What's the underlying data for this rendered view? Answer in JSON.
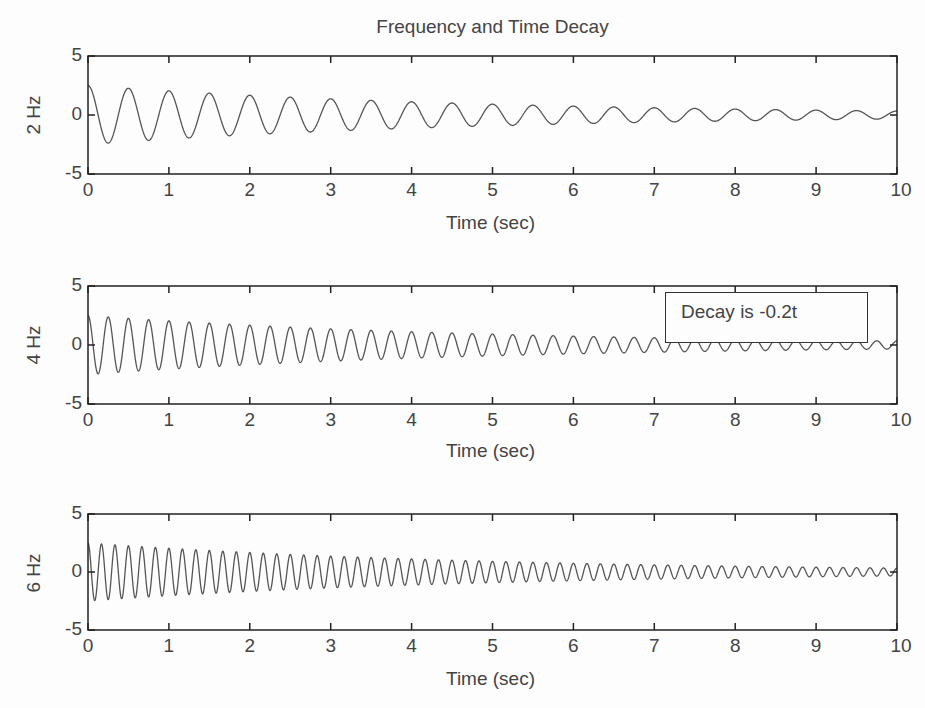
{
  "figure": {
    "title": "Frequency and Time Decay",
    "width": 925,
    "height": 708,
    "line_color": "#555555",
    "axes_color": "#222222"
  },
  "chart_data": [
    {
      "type": "line",
      "title": "Frequency and Time Decay",
      "xlabel": "Time (sec)",
      "ylabel": "2 Hz",
      "xlim": [
        0,
        10
      ],
      "ylim": [
        -5,
        5
      ],
      "xticks": [
        "0",
        "1",
        "2",
        "3",
        "4",
        "5",
        "6",
        "7",
        "8",
        "9",
        "10"
      ],
      "yticks": [
        "5",
        "0",
        "-5"
      ],
      "grid": false,
      "series": [
        {
          "name": "2 Hz",
          "function": "2.5*exp(-0.2t)*cos(2*pi*2*t)",
          "frequency_hz": 2,
          "amplitude": 2.5,
          "decay": -0.2
        }
      ],
      "box": {
        "left": 88,
        "top": 56,
        "right": 897,
        "bottom": 174
      }
    },
    {
      "type": "line",
      "xlabel": "Time (sec)",
      "ylabel": "4 Hz",
      "xlim": [
        0,
        10
      ],
      "ylim": [
        -5,
        5
      ],
      "xticks": [
        "0",
        "1",
        "2",
        "3",
        "4",
        "5",
        "6",
        "7",
        "8",
        "9",
        "10"
      ],
      "yticks": [
        "5",
        "0",
        "-5"
      ],
      "grid": false,
      "series": [
        {
          "name": "4 Hz",
          "function": "2.5*exp(-0.2t)*cos(2*pi*4*t)",
          "frequency_hz": 4,
          "amplitude": 2.5,
          "decay": -0.2
        }
      ],
      "annotation": {
        "text": "Decay is -0.2t",
        "left": 665,
        "top": 292,
        "width": 203,
        "height": 51
      },
      "box": {
        "left": 88,
        "top": 286,
        "right": 897,
        "bottom": 404
      }
    },
    {
      "type": "line",
      "xlabel": "Time (sec)",
      "ylabel": "6 Hz",
      "xlim": [
        0,
        10
      ],
      "ylim": [
        -5,
        5
      ],
      "xticks": [
        "0",
        "1",
        "2",
        "3",
        "4",
        "5",
        "6",
        "7",
        "8",
        "9",
        "10"
      ],
      "yticks": [
        "5",
        "0",
        "-5"
      ],
      "grid": false,
      "series": [
        {
          "name": "6 Hz",
          "function": "2.5*exp(-0.2t)*cos(2*pi*6*t)",
          "frequency_hz": 6,
          "amplitude": 2.5,
          "decay": -0.2
        }
      ],
      "box": {
        "left": 88,
        "top": 514,
        "right": 897,
        "bottom": 630
      }
    }
  ]
}
